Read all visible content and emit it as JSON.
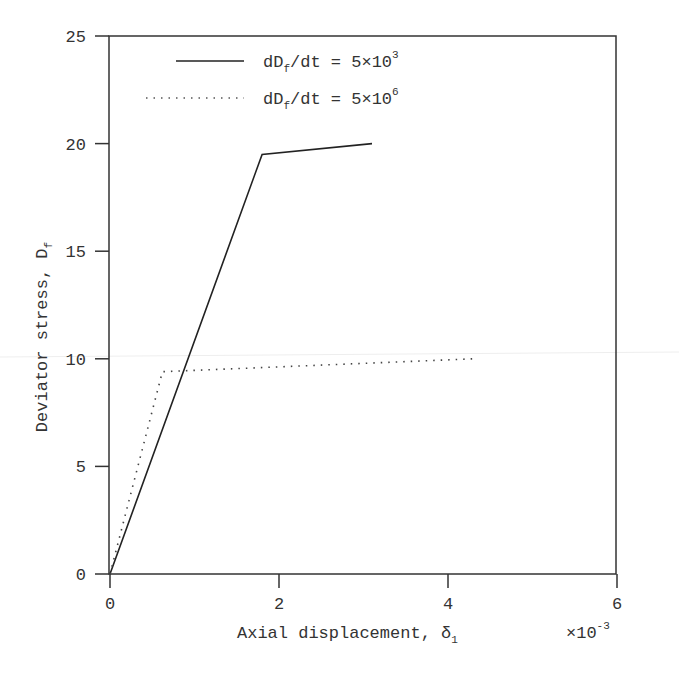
{
  "chart_data": {
    "type": "line",
    "title": "",
    "xlabel": "Axial displacement, δ₁",
    "xlabel_main": "Axial displacement, δ",
    "xlabel_sub": "1",
    "x_multiplier": "×10",
    "x_multiplier_exp": "-3",
    "ylabel": "Deviator stress, D_f",
    "ylabel_main": "Deviator stress, D",
    "ylabel_sub": "f",
    "xlim": [
      0,
      6
    ],
    "ylim": [
      0,
      25
    ],
    "xticks": [
      0,
      2,
      4,
      6
    ],
    "yticks": [
      0,
      5,
      10,
      15,
      20,
      25
    ],
    "grid": false,
    "legend_position": "upper left",
    "series": [
      {
        "name": "dD_f/dt = 5×10^3",
        "label_main": "dD",
        "label_sub": "f",
        "label_rest": "/dt = 5×10",
        "label_exp": "3",
        "style": "solid",
        "color": "#222222",
        "x": [
          0,
          1.8,
          3.1
        ],
        "y": [
          0,
          19.5,
          20.0
        ]
      },
      {
        "name": "dD_f/dt = 5×10^6",
        "label_main": "dD",
        "label_sub": "f",
        "label_rest": "/dt = 5×10",
        "label_exp": "6",
        "style": "dotted",
        "color": "#444444",
        "x": [
          0,
          0.62,
          4.3
        ],
        "y": [
          0,
          9.4,
          10.0
        ]
      }
    ]
  },
  "colors": {
    "axis": "#333333",
    "text": "#333333",
    "background": "#ffffff"
  }
}
